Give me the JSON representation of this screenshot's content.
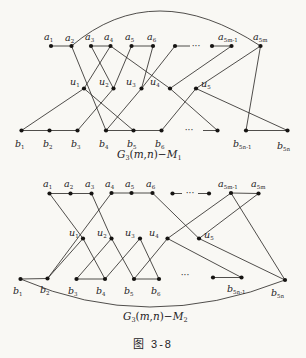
{
  "figure": {
    "caption": "图 3-8"
  },
  "colors": {
    "ink": "#24221f",
    "paper": "#f9f8f4"
  },
  "graphs": [
    {
      "name": "G3(m,n)-M1",
      "svg_height": 166,
      "caption": {
        "x": 117,
        "y": 158,
        "parts": [
          [
            "G",
            "it"
          ],
          [
            "3",
            "sub"
          ],
          [
            "(",
            "n"
          ],
          [
            "m",
            "it"
          ],
          [
            ",",
            "n"
          ],
          [
            "n",
            "it"
          ],
          [
            ")−",
            "n"
          ],
          [
            "M",
            "it"
          ],
          [
            "1",
            "sub"
          ]
        ]
      },
      "nodes": [
        {
          "id": "a1",
          "x": 51,
          "y": 46,
          "label": {
            "t": "a",
            "sub": "1",
            "lx": 44,
            "ly": 40
          }
        },
        {
          "id": "a2",
          "x": 71.5,
          "y": 46,
          "label": {
            "t": "a",
            "sub": "2",
            "lx": 65,
            "ly": 41
          }
        },
        {
          "id": "a3",
          "x": 91,
          "y": 46,
          "label": {
            "t": "a",
            "sub": "3",
            "lx": 85,
            "ly": 40
          }
        },
        {
          "id": "a4",
          "x": 110.5,
          "y": 46,
          "label": {
            "t": "a",
            "sub": "4",
            "lx": 104,
            "ly": 40
          }
        },
        {
          "id": "a5",
          "x": 131.5,
          "y": 46,
          "label": {
            "t": "a",
            "sub": "5",
            "lx": 125,
            "ly": 40
          }
        },
        {
          "id": "a6",
          "x": 153,
          "y": 46,
          "label": {
            "t": "a",
            "sub": "6",
            "lx": 147,
            "ly": 40
          }
        },
        {
          "id": "n7",
          "x": 175,
          "y": 46,
          "label": null
        },
        {
          "id": "n8",
          "x": 212,
          "y": 46,
          "label": null
        },
        {
          "id": "a5m1",
          "x": 231.5,
          "y": 46,
          "label": {
            "t": "a",
            "sub": "5m-1",
            "lx": 218,
            "ly": 40
          }
        },
        {
          "id": "a5m",
          "x": 260.5,
          "y": 46,
          "label": {
            "t": "a",
            "sub": "5m",
            "lx": 253,
            "ly": 40
          }
        },
        {
          "id": "u1",
          "x": 84,
          "y": 88.5,
          "label": {
            "t": "u",
            "sub": "1",
            "lx": 70,
            "ly": 85
          }
        },
        {
          "id": "u2",
          "x": 113.5,
          "y": 88.5,
          "label": {
            "t": "u",
            "sub": "2",
            "lx": 99,
            "ly": 85
          }
        },
        {
          "id": "u3",
          "x": 141.5,
          "y": 88.5,
          "label": {
            "t": "u",
            "sub": "3",
            "lx": 126,
            "ly": 85
          }
        },
        {
          "id": "u4",
          "x": 170,
          "y": 88.5,
          "label": {
            "t": "u",
            "sub": "4",
            "lx": 150,
            "ly": 85
          }
        },
        {
          "id": "u5",
          "x": 196,
          "y": 88.5,
          "label": {
            "t": "u",
            "sub": "5",
            "lx": 201,
            "ly": 87
          }
        },
        {
          "id": "b1",
          "x": 21.5,
          "y": 130.5,
          "label": {
            "t": "b",
            "sub": "1",
            "lx": 15,
            "ly": 147
          }
        },
        {
          "id": "b2",
          "x": 49.5,
          "y": 130.5,
          "label": {
            "t": "b",
            "sub": "2",
            "lx": 43,
            "ly": 147
          }
        },
        {
          "id": "b3",
          "x": 77.5,
          "y": 130.5,
          "label": {
            "t": "b",
            "sub": "3",
            "lx": 71,
            "ly": 147
          }
        },
        {
          "id": "b4",
          "x": 106,
          "y": 130.5,
          "label": {
            "t": "b",
            "sub": "4",
            "lx": 99,
            "ly": 147
          }
        },
        {
          "id": "b5",
          "x": 133.5,
          "y": 130.5,
          "label": {
            "t": "b",
            "sub": "5",
            "lx": 127,
            "ly": 147
          }
        },
        {
          "id": "b6",
          "x": 161.5,
          "y": 130.5,
          "label": {
            "t": "b",
            "sub": "6",
            "lx": 155,
            "ly": 147
          }
        },
        {
          "id": "nb",
          "x": 217.5,
          "y": 130.5,
          "label": null
        },
        {
          "id": "b5n1",
          "x": 246,
          "y": 130.5,
          "label": {
            "t": "b",
            "sub": "5n-1",
            "lx": 233,
            "ly": 147
          }
        },
        {
          "id": "b5n",
          "x": 287.5,
          "y": 130.5,
          "label": {
            "t": "b",
            "sub": "5n",
            "lx": 277,
            "ly": 149
          }
        }
      ],
      "edges": [
        [
          "a1",
          "a2"
        ],
        [
          "a3",
          "a4"
        ],
        [
          "a5",
          "a6"
        ],
        [
          "n8",
          "a5m1"
        ],
        [
          "b1",
          "b2"
        ],
        [
          "b2",
          "b3"
        ],
        [
          "b4",
          "b5"
        ],
        [
          "b5",
          "b6"
        ],
        [
          "b5n1",
          "b5n"
        ],
        [
          "b1",
          "u1"
        ],
        [
          "u1",
          "a4"
        ],
        [
          "u1",
          "b5"
        ],
        [
          "a2",
          "b4"
        ],
        [
          "a3",
          "u2"
        ],
        [
          "b3",
          "u2"
        ],
        [
          "a5",
          "u2"
        ],
        [
          "a6",
          "u3"
        ],
        [
          "n7",
          "u3"
        ],
        [
          "u3",
          "b4"
        ],
        [
          "a4",
          "u4"
        ],
        [
          "u4",
          "a5m1"
        ],
        [
          "u4",
          "nb"
        ],
        [
          "a5m",
          "u5"
        ],
        [
          "u5",
          "b6"
        ],
        [
          "u5",
          "b5n"
        ],
        [
          "b5n1",
          "a5m"
        ]
      ],
      "stubs": [
        [
          175,
          46,
          190,
          46
        ],
        [
          203,
          130.5,
          217.5,
          130.5
        ]
      ],
      "arc": {
        "from": "a2",
        "to": "a5m",
        "cx": 154,
        "cy": -24
      },
      "dots": [
        {
          "x": 196,
          "y": 48.5
        },
        {
          "x": 189,
          "y": 133
        }
      ]
    },
    {
      "name": "G3(m,n)-M2",
      "svg_height": 192,
      "caption": {
        "x": 123,
        "y": 154,
        "parts": [
          [
            "G",
            "it"
          ],
          [
            "3",
            "sub"
          ],
          [
            "(",
            "n"
          ],
          [
            "m",
            "it"
          ],
          [
            ",",
            "n"
          ],
          [
            "n",
            "it"
          ],
          [
            ")−",
            "n"
          ],
          [
            "M",
            "it"
          ],
          [
            "2",
            "sub"
          ]
        ]
      },
      "nodes": [
        {
          "id": "a1",
          "x": 49.5,
          "y": 27.5,
          "label": {
            "t": "a",
            "sub": "1",
            "lx": 43,
            "ly": 21
          }
        },
        {
          "id": "a2",
          "x": 70.5,
          "y": 27.5,
          "label": {
            "t": "a",
            "sub": "2",
            "lx": 64,
            "ly": 21
          }
        },
        {
          "id": "a3",
          "x": 91.5,
          "y": 27.5,
          "label": {
            "t": "a",
            "sub": "3",
            "lx": 85,
            "ly": 21
          }
        },
        {
          "id": "a4",
          "x": 111.5,
          "y": 27,
          "label": {
            "t": "a",
            "sub": "4",
            "lx": 105,
            "ly": 21
          }
        },
        {
          "id": "a5",
          "x": 131.5,
          "y": 27,
          "label": {
            "t": "a",
            "sub": "5",
            "lx": 125,
            "ly": 21
          }
        },
        {
          "id": "a6",
          "x": 152.5,
          "y": 27,
          "label": {
            "t": "a",
            "sub": "6",
            "lx": 146,
            "ly": 21
          }
        },
        {
          "id": "n7",
          "x": 172.5,
          "y": 27.5,
          "label": null
        },
        {
          "id": "n8",
          "x": 209,
          "y": 27.5,
          "label": null
        },
        {
          "id": "a5m1",
          "x": 231,
          "y": 27,
          "label": {
            "t": "a",
            "sub": "5m-1",
            "lx": 218,
            "ly": 21
          }
        },
        {
          "id": "a5m",
          "x": 258.5,
          "y": 27.5,
          "label": {
            "t": "a",
            "sub": "5m",
            "lx": 251,
            "ly": 21
          }
        },
        {
          "id": "u1",
          "x": 83,
          "y": 72.5,
          "label": {
            "t": "u",
            "sub": "1",
            "lx": 69,
            "ly": 70
          }
        },
        {
          "id": "u2",
          "x": 111.5,
          "y": 72.5,
          "label": {
            "t": "u",
            "sub": "2",
            "lx": 97,
            "ly": 70
          }
        },
        {
          "id": "u3",
          "x": 140,
          "y": 72.5,
          "label": {
            "t": "u",
            "sub": "3",
            "lx": 125,
            "ly": 70
          }
        },
        {
          "id": "u4",
          "x": 167.5,
          "y": 72.5,
          "label": {
            "t": "u",
            "sub": "4",
            "lx": 149,
            "ly": 70
          }
        },
        {
          "id": "u5",
          "x": 199,
          "y": 72.5,
          "label": {
            "t": "u",
            "sub": "5",
            "lx": 204,
            "ly": 72
          }
        },
        {
          "id": "b1",
          "x": 20.5,
          "y": 113,
          "label": {
            "t": "b",
            "sub": "1",
            "lx": 13,
            "ly": 128
          }
        },
        {
          "id": "b2",
          "x": 47.5,
          "y": 112.5,
          "label": {
            "t": "b",
            "sub": "2",
            "lx": 40,
            "ly": 127
          }
        },
        {
          "id": "b3",
          "x": 76.5,
          "y": 113,
          "label": {
            "t": "b",
            "sub": "3",
            "lx": 68,
            "ly": 128
          }
        },
        {
          "id": "b4",
          "x": 105,
          "y": 113,
          "label": {
            "t": "b",
            "sub": "4",
            "lx": 96,
            "ly": 128
          }
        },
        {
          "id": "b5",
          "x": 134,
          "y": 113,
          "label": {
            "t": "b",
            "sub": "5",
            "lx": 124,
            "ly": 128
          }
        },
        {
          "id": "b6",
          "x": 159,
          "y": 113,
          "label": {
            "t": "b",
            "sub": "6",
            "lx": 151,
            "ly": 128
          }
        },
        {
          "id": "nb",
          "x": 213,
          "y": 111.5,
          "label": null
        },
        {
          "id": "b5n1",
          "x": 241.5,
          "y": 111.5,
          "label": {
            "t": "b",
            "sub": "5n-1",
            "lx": 227,
            "ly": 126
          }
        },
        {
          "id": "b5n",
          "x": 285,
          "y": 114,
          "label": {
            "t": "b",
            "sub": "5n",
            "lx": 271,
            "ly": 130
          }
        }
      ],
      "edges": [
        [
          "a1",
          "a2"
        ],
        [
          "a2",
          "a3"
        ],
        [
          "a4",
          "a5"
        ],
        [
          "a5",
          "a6"
        ],
        [
          "a5m1",
          "a5m"
        ],
        [
          "b1",
          "b2"
        ],
        [
          "b3",
          "b4"
        ],
        [
          "b5",
          "b6"
        ],
        [
          "nb",
          "b5n1"
        ],
        [
          "a1",
          "u1"
        ],
        [
          "u1",
          "b2"
        ],
        [
          "u1",
          "b4"
        ],
        [
          "b2",
          "a4"
        ],
        [
          "a3",
          "u2"
        ],
        [
          "b3",
          "u2"
        ],
        [
          "u2",
          "b5"
        ],
        [
          "b4",
          "u3"
        ],
        [
          "u3",
          "b6"
        ],
        [
          "u4",
          "b5"
        ],
        [
          "u4",
          "a5m1"
        ],
        [
          "u4",
          "b5n1"
        ],
        [
          "u5",
          "a6"
        ],
        [
          "u5",
          "a5m"
        ],
        [
          "u5",
          "b5n"
        ],
        [
          "a5m1",
          "b5n"
        ]
      ],
      "stubs": [
        [
          172.5,
          27.5,
          182,
          27.5
        ],
        [
          198,
          27.5,
          209,
          27.5
        ]
      ],
      "arc": {
        "from": "b1",
        "to": "b5n",
        "cx": 147,
        "cy": 168.5
      },
      "dots": [
        {
          "x": 190,
          "y": 30
        },
        {
          "x": 185,
          "y": 112
        }
      ]
    }
  ]
}
